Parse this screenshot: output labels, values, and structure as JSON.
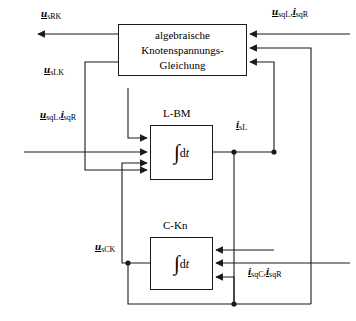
{
  "diagram": {
    "stroke_color": "#1a1a1a",
    "background": "#ffffff"
  },
  "blocks": [
    {
      "id": "algebraic-node-voltage-equation",
      "name": "main-block",
      "lines": [
        "algebraische",
        "Knotenspannungs-",
        "Gleichung"
      ]
    },
    {
      "id": "l-bm",
      "name": "l-bm-block",
      "label": "L-BM",
      "integral_symbol": "∫",
      "integral_d": "d",
      "integral_var": "t"
    },
    {
      "id": "c-kn",
      "name": "c-kn-block",
      "label": "C-Kn",
      "integral_symbol": "∫",
      "integral_d": "d",
      "integral_var": "t"
    }
  ],
  "signals": {
    "u_sRK": {
      "var": "u",
      "sub": "sRK"
    },
    "u_sqL": {
      "var": "u",
      "sub": "sqL"
    },
    "i_sqR": {
      "var": "i",
      "sub": "sqR"
    },
    "u_sLK": {
      "var": "u",
      "sub": "sLK"
    },
    "i_sL": {
      "var": "i",
      "sub": "sL"
    },
    "u_sCK": {
      "var": "u",
      "sub": "sCK"
    },
    "i_sqC": {
      "var": "i",
      "sub": "sqC"
    },
    "separator": ","
  }
}
